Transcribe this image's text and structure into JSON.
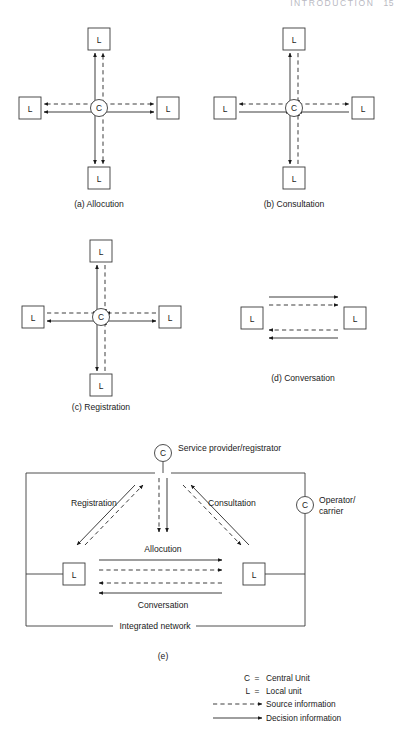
{
  "page": {
    "running_head": "INTRODUCTION",
    "folio": "15"
  },
  "figure": {
    "panels": [
      {
        "id": "a",
        "caption": "(a) Allocution",
        "center_label": "C",
        "node_label": "L"
      },
      {
        "id": "b",
        "caption": "(b) Consultation",
        "center_label": "C",
        "node_label": "L"
      },
      {
        "id": "c",
        "caption": "(c) Registration",
        "center_label": "C",
        "node_label": "L"
      },
      {
        "id": "d",
        "caption": "(d) Conversation",
        "node_label_left": "L",
        "node_label_right": "L"
      },
      {
        "id": "e",
        "caption": "(e)"
      }
    ],
    "panel_e": {
      "top_node_label": "C",
      "top_node_caption": "Service provider/registrator",
      "right_node_label": "C",
      "right_node_caption_line1": "Operator/",
      "right_node_caption_line2": "carrier",
      "left_box_label": "L",
      "right_box_label": "L",
      "flow_registration": "Registration",
      "flow_consultation": "Consultation",
      "flow_allocution": "Allocution",
      "flow_conversation": "Conversation",
      "network_label": "Integrated network"
    },
    "legend": {
      "items": [
        {
          "key": "C",
          "eq": "=",
          "text": "Central Unit",
          "glyph": "none"
        },
        {
          "key": "L",
          "eq": "=",
          "text": "Local unit",
          "glyph": "none"
        },
        {
          "key": "",
          "eq": "",
          "text": "Source information",
          "glyph": "dashed-arrow"
        },
        {
          "key": "",
          "eq": "",
          "text": "Decision information",
          "glyph": "solid-arrow"
        }
      ]
    },
    "colors": {
      "ink": "#1a1a1a",
      "stroke": "#3a3a3a",
      "paper": "#ffffff",
      "running_head": "#b9b9c2"
    }
  }
}
